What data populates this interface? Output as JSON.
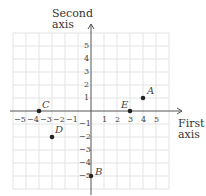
{
  "y_axis_title": [
    "Second",
    "axis"
  ],
  "x_axis_title": [
    "First",
    "axis"
  ],
  "x_ticks_neg": [
    "−5",
    "−4",
    "−3",
    "−2",
    "−1"
  ],
  "x_ticks_pos": [
    "1",
    "2",
    "3",
    "4",
    "5"
  ],
  "y_ticks_pos": [
    "1",
    "2",
    "3",
    "4",
    "5"
  ],
  "y_ticks_neg": [
    "−1",
    "−2",
    "−3",
    "−4",
    "−5"
  ],
  "points": [
    {
      "label": "A",
      "x": 4,
      "y": 1
    },
    {
      "label": "B",
      "x": 0,
      "y": -5
    },
    {
      "label": "C",
      "x": -4,
      "y": 0
    },
    {
      "label": "D",
      "x": -3,
      "y": -2
    },
    {
      "label": "E",
      "x": 3,
      "y": 0
    }
  ],
  "colors": {
    "grid": "#e3e3e3",
    "axis": "#555555",
    "point": "#222222"
  }
}
